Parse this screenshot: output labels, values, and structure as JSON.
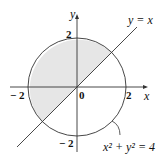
{
  "diagram": {
    "axes": {
      "x_label": "x",
      "y_label": "y"
    },
    "ticks": {
      "x_neg": "− 2",
      "x_pos": "2",
      "y_pos": "2",
      "y_neg": "− 2",
      "origin": "0"
    },
    "curves": {
      "circle_label": "x² + y² = 4",
      "line_label": "y = x"
    },
    "colors": {
      "shade": "#e6e6e6",
      "stroke": "#333333"
    }
  }
}
